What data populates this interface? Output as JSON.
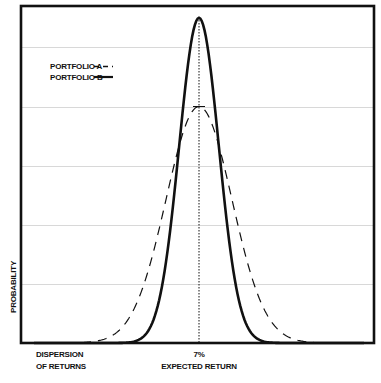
{
  "chart_data": {
    "type": "line",
    "title": "",
    "xlabel": "EXPECTED RETURN",
    "ylabel": "PROBABILITY",
    "x_tick_labels": [
      {
        "x": -1.0,
        "lines": [
          "DISPERSION",
          "OF RETURNS"
        ]
      },
      {
        "x": 0.0,
        "lines": [
          "7%",
          "EXPECTED RETURN"
        ]
      }
    ],
    "center_label": "7%",
    "center_value_percent": 7,
    "reference_line": {
      "x": 0,
      "style": "dotted"
    },
    "grid": {
      "horizontal": true,
      "vertical": false,
      "y_levels": [
        0.2,
        0.4,
        0.6,
        0.8,
        1.0
      ]
    },
    "xlim": [
      -1.0,
      1.0
    ],
    "ylim": [
      0,
      1.14
    ],
    "legend": {
      "placement": "top-left",
      "entries": [
        {
          "name": "PORTFOLIO A",
          "style": "dashed"
        },
        {
          "name": "PORTFOLIO B",
          "style": "solid"
        }
      ]
    },
    "series": [
      {
        "name": "PORTFOLIO A",
        "style": "dashed",
        "distribution": "normal",
        "mean": 0,
        "peak": 0.8,
        "sigma": 0.2
      },
      {
        "name": "PORTFOLIO B",
        "style": "solid",
        "distribution": "normal",
        "peak": 1.1,
        "mean": 0,
        "sigma": 0.12
      }
    ]
  },
  "colors": {
    "axis": "#111111",
    "grid": "#d8d8d8",
    "line": "#111111"
  }
}
